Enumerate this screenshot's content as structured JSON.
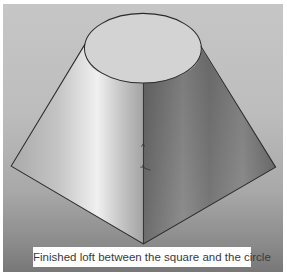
{
  "figure": {
    "caption": "Finished loft between the square and the circle",
    "colors": {
      "background_top": "#c6c6c6",
      "background_bottom": "#777777",
      "left_face_light": "#ececec",
      "left_face_mid": "#b9b9b9",
      "right_face_dark": "#6a6a6a",
      "right_face_mid": "#8d8d8d",
      "top_ellipse": "#d4d4d4",
      "edge": "#2a2a2a",
      "caption_bg": "#ffffff",
      "caption_text": "#3a3a3a"
    }
  }
}
